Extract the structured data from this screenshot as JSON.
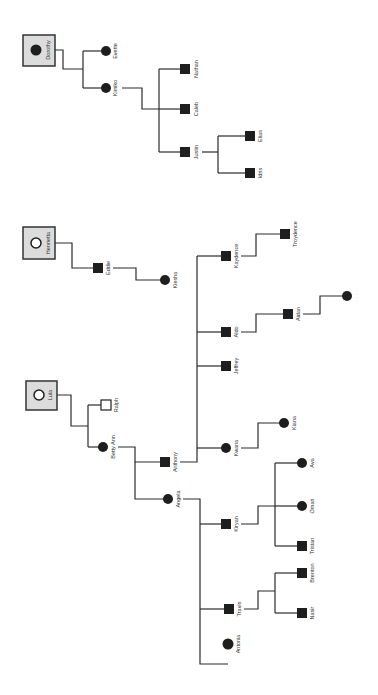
{
  "diagram": {
    "type": "family-tree",
    "orientation": "rotated-90-ccw",
    "colors": {
      "line": "#2b2b2b",
      "node_fill": "#1e1e1e",
      "root_box_fill": "#dcdcdc",
      "root_box_stroke": "#333333",
      "label": "#333333",
      "background": "#ffffff"
    },
    "roots": [
      {
        "id": "dorothy",
        "label": "Dorothy",
        "symbol": "filled-circle"
      },
      {
        "id": "henrietta",
        "label": "Henrietta",
        "symbol": "hollow-circle"
      },
      {
        "id": "lula",
        "label": "Lula",
        "symbol": "hollow-circle"
      }
    ],
    "nodes": [
      {
        "id": "evette",
        "label": "Evette",
        "shape": "circle",
        "fill": "filled"
      },
      {
        "id": "kimiko",
        "label": "Kimiko",
        "shape": "circle",
        "fill": "filled"
      },
      {
        "id": "nathan",
        "label": "Nathan",
        "shape": "square",
        "fill": "filled"
      },
      {
        "id": "caleb",
        "label": "Caleb",
        "shape": "square",
        "fill": "filled"
      },
      {
        "id": "justin",
        "label": "Justin",
        "shape": "square",
        "fill": "filled"
      },
      {
        "id": "elias",
        "label": "Elias",
        "shape": "square",
        "fill": "filled"
      },
      {
        "id": "idris",
        "label": "Idris",
        "shape": "square",
        "fill": "filled"
      },
      {
        "id": "eddie",
        "label": "Eddie",
        "shape": "square",
        "fill": "filled"
      },
      {
        "id": "kiesha",
        "label": "Kiesha",
        "shape": "circle",
        "fill": "filled"
      },
      {
        "id": "ralph",
        "label": "Ralph",
        "shape": "square",
        "fill": "hollow"
      },
      {
        "id": "bettyann",
        "label": "Betty Ann",
        "shape": "circle",
        "fill": "filled"
      },
      {
        "id": "anthony",
        "label": "Anthony",
        "shape": "square",
        "fill": "filled"
      },
      {
        "id": "kaydence",
        "label": "Kaydence",
        "shape": "square",
        "fill": "filled"
      },
      {
        "id": "troydence",
        "label": "Troydence",
        "shape": "square",
        "fill": "filled"
      },
      {
        "id": "aldo",
        "label": "Aldo",
        "shape": "square",
        "fill": "filled"
      },
      {
        "id": "aidan",
        "label": "Aidan",
        "shape": "square",
        "fill": "filled"
      },
      {
        "id": "unknown",
        "label": "· · · ·",
        "shape": "circle",
        "fill": "filled"
      },
      {
        "id": "jeffrey",
        "label": "Jeffrey",
        "shape": "square",
        "fill": "filled"
      },
      {
        "id": "kwana",
        "label": "Kwana",
        "shape": "circle",
        "fill": "filled"
      },
      {
        "id": "kiana",
        "label": "Kiana",
        "shape": "circle",
        "fill": "filled"
      },
      {
        "id": "angela",
        "label": "Angela",
        "shape": "circle",
        "fill": "filled"
      },
      {
        "id": "kiryan",
        "label": "Kiryan",
        "shape": "square",
        "fill": "filled"
      },
      {
        "id": "ava",
        "label": "Ava",
        "shape": "circle",
        "fill": "filled"
      },
      {
        "id": "omari",
        "label": "Omari",
        "shape": "circle",
        "fill": "filled"
      },
      {
        "id": "tristan",
        "label": "Tristan",
        "shape": "square",
        "fill": "filled"
      },
      {
        "id": "travis",
        "label": "Travis",
        "shape": "square",
        "fill": "filled"
      },
      {
        "id": "brenton",
        "label": "Brenton",
        "shape": "square",
        "fill": "filled"
      },
      {
        "id": "nasir",
        "label": "Nasir",
        "shape": "square",
        "fill": "filled"
      },
      {
        "id": "antonia",
        "label": "Antonia",
        "shape": "circle",
        "fill": "filled"
      }
    ],
    "edges": [
      [
        "dorothy",
        "evette"
      ],
      [
        "dorothy",
        "kimiko"
      ],
      [
        "kimiko",
        "nathan"
      ],
      [
        "kimiko",
        "caleb"
      ],
      [
        "kimiko",
        "justin"
      ],
      [
        "justin",
        "elias"
      ],
      [
        "justin",
        "idris"
      ],
      [
        "henrietta",
        "eddie"
      ],
      [
        "eddie",
        "kiesha"
      ],
      [
        "lula",
        "ralph"
      ],
      [
        "lula",
        "bettyann"
      ],
      [
        "bettyann",
        "anthony"
      ],
      [
        "bettyann",
        "angela"
      ],
      [
        "anthony",
        "kaydence"
      ],
      [
        "anthony",
        "aldo"
      ],
      [
        "anthony",
        "jeffrey"
      ],
      [
        "anthony",
        "kwana"
      ],
      [
        "kaydence",
        "troydence"
      ],
      [
        "aldo",
        "aidan"
      ],
      [
        "aidan",
        "unknown"
      ],
      [
        "kwana",
        "kiana"
      ],
      [
        "angela",
        "kiryan"
      ],
      [
        "angela",
        "travis"
      ],
      [
        "angela",
        "antonia"
      ],
      [
        "kiryan",
        "ava"
      ],
      [
        "kiryan",
        "omari"
      ],
      [
        "kiryan",
        "tristan"
      ],
      [
        "travis",
        "brenton"
      ],
      [
        "travis",
        "nasir"
      ]
    ]
  }
}
